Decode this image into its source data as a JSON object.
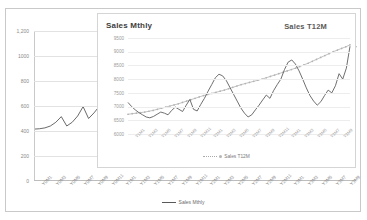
{
  "chart_data": [
    {
      "id": "outer",
      "type": "line",
      "title": "",
      "series_name": "Sales Mthly",
      "legend": "Sales Mthly",
      "legend_position": "bottom-center",
      "grid": true,
      "xlabel": "",
      "ylabel": "",
      "ylim": [
        0,
        1200
      ],
      "yticks": [
        "0",
        "200",
        "400",
        "600",
        "800",
        "1000",
        "1,200"
      ],
      "ytick_values": [
        0,
        200,
        400,
        600,
        800,
        1000,
        1200
      ],
      "categories": [
        "Y0M1",
        "Y0M3",
        "Y0M5",
        "Y0M7",
        "Y0M9",
        "Y0M11",
        "Y1M1",
        "Y1M3",
        "Y1M5",
        "Y1M7",
        "Y1M9",
        "Y1M11",
        "Y2M1",
        "Y2M3",
        "Y2M5",
        "Y2M7",
        "Y2M9",
        "Y2M11",
        "Y3M1",
        "Y3M3",
        "Y3M5",
        "Y3M7",
        "Y3M9"
      ],
      "values": [
        415,
        418,
        425,
        440,
        470,
        515,
        440,
        470,
        520,
        595,
        500,
        545,
        600,
        660,
        690,
        700,
        672,
        640,
        600,
        555,
        520,
        560,
        615,
        585,
        640,
        700,
        740,
        810,
        820,
        760,
        700,
        640,
        590,
        520,
        470,
        540,
        600,
        580,
        620,
        700,
        760,
        790,
        860,
        940,
        900,
        840,
        760,
        660,
        580,
        620,
        660,
        700,
        690,
        650,
        720,
        820,
        790,
        760,
        900,
        1080
      ],
      "series_color": "#595959"
    },
    {
      "id": "inner",
      "type": "line",
      "title": "Sales Mthly",
      "title_right": "Sales T12M",
      "legend": "Sales T12M",
      "legend_position": "bottom-center",
      "grid": true,
      "xlabel": "",
      "ylabel": "",
      "ylim": [
        6000,
        9500
      ],
      "yticks": [
        "9500",
        "9000",
        "8500",
        "8000",
        "7500",
        "7000",
        "6500",
        "6000"
      ],
      "ytick_values": [
        9500,
        9000,
        8500,
        8000,
        7500,
        7000,
        6500,
        6000
      ],
      "categories": [
        "Y1M1",
        "Y1M3",
        "Y1M5",
        "Y1M7",
        "Y1M9",
        "Y1M11",
        "Y2M1",
        "Y2M3",
        "Y2M5",
        "Y2M7",
        "Y2M9",
        "Y2M11",
        "Y3M1",
        "Y3M3",
        "Y3M5",
        "Y3M7",
        "Y3M9"
      ],
      "series": [
        {
          "name": "Sales Mthly",
          "color": "#5f5f5f",
          "style": "solid",
          "values": [
            7150,
            7000,
            6880,
            6780,
            6700,
            6620,
            6590,
            6640,
            6720,
            6800,
            6760,
            6700,
            6860,
            6980,
            6900,
            6820,
            7050,
            7260,
            6900,
            6840,
            7080,
            7300,
            7560,
            7800,
            8050,
            8180,
            8120,
            7950,
            7700,
            7450,
            7200,
            6950,
            6760,
            6620,
            6700,
            6880,
            7050,
            7240,
            7420,
            7300,
            7580,
            7800,
            8000,
            8350,
            8620,
            8700,
            8550,
            8300,
            8000,
            7680,
            7400,
            7200,
            7050,
            7180,
            7400,
            7600,
            7500,
            7760,
            8200,
            8000,
            8400,
            9200
          ]
        },
        {
          "name": "Sales T12M",
          "color": "#b3b3b3",
          "style": "dotted-markers",
          "values": [
            6720,
            6740,
            6760,
            6780,
            6800,
            6830,
            6860,
            6900,
            6940,
            6980,
            7020,
            7060,
            7100,
            7150,
            7200,
            7250,
            7300,
            7350,
            7400,
            7440,
            7480,
            7520,
            7560,
            7600,
            7650,
            7700,
            7750,
            7800,
            7840,
            7880,
            7920,
            7960,
            8000,
            8050,
            8100,
            8150,
            8200,
            8250,
            8300,
            8350,
            8400,
            8460,
            8520,
            8580,
            8650,
            8720,
            8790,
            8860,
            8930,
            9000,
            9060,
            9120,
            9180,
            9250
          ]
        }
      ]
    }
  ]
}
